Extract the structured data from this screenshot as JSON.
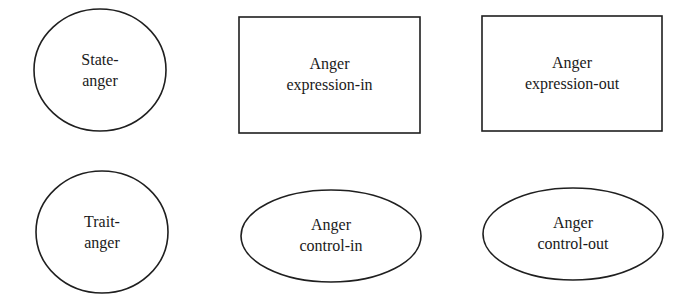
{
  "diagram": {
    "nodes": [
      {
        "id": "state-anger",
        "shape": "circle",
        "lines": [
          "State-",
          "anger"
        ],
        "geom": {
          "cx": 100,
          "cy": 70,
          "rx": 66,
          "ry": 61
        }
      },
      {
        "id": "anger-expression-in",
        "shape": "rectangle",
        "lines": [
          "Anger",
          "expression-in"
        ],
        "geom": {
          "x": 239,
          "y": 17,
          "w": 181,
          "h": 116
        }
      },
      {
        "id": "anger-expression-out",
        "shape": "rectangle",
        "lines": [
          "Anger",
          "expression-out"
        ],
        "geom": {
          "x": 482,
          "y": 16,
          "w": 180,
          "h": 115
        }
      },
      {
        "id": "trait-anger",
        "shape": "circle",
        "lines": [
          "Trait-",
          "anger"
        ],
        "geom": {
          "cx": 102,
          "cy": 232,
          "rx": 66,
          "ry": 61
        }
      },
      {
        "id": "anger-control-in",
        "shape": "ellipse",
        "lines": [
          "Anger",
          "control-in"
        ],
        "geom": {
          "cx": 331,
          "cy": 236,
          "rx": 90,
          "ry": 46
        }
      },
      {
        "id": "anger-control-out",
        "shape": "ellipse",
        "lines": [
          "Anger",
          "control-out"
        ],
        "geom": {
          "cx": 573,
          "cy": 234,
          "rx": 90,
          "ry": 46
        }
      }
    ],
    "colors": {
      "stroke": "#1f1f1f",
      "text": "#1a1a1a",
      "background": "#ffffff"
    }
  }
}
